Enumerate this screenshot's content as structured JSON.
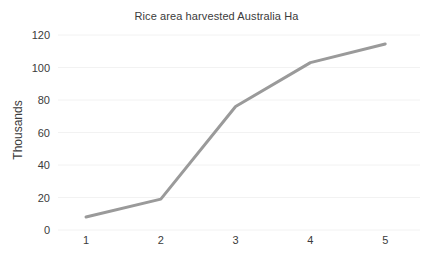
{
  "chart_data": {
    "type": "line",
    "title": "Rice area harvested Australia Ha",
    "xlabel": "",
    "ylabel": "Thousands",
    "x": [
      1,
      2,
      3,
      4,
      5
    ],
    "categories": [
      "1",
      "2",
      "3",
      "4",
      "5"
    ],
    "values": [
      8,
      19,
      76,
      103,
      114.5
    ],
    "series": [
      {
        "name": "Rice area harvested Australia Ha",
        "values": [
          8,
          19,
          76,
          103,
          114.5
        ]
      }
    ],
    "ylim": [
      0,
      120
    ],
    "yticks": [
      0,
      20,
      40,
      60,
      80,
      100,
      120
    ],
    "ytick_labels": [
      "0",
      "20",
      "40",
      "60",
      "80",
      "100",
      "120"
    ],
    "xtick_labels": [
      "1",
      "2",
      "3",
      "4",
      "5"
    ],
    "grid": "horizontal",
    "legend": "none",
    "line_color": "#9a9a9a",
    "grid_color": "#f2f2f2",
    "text_color": "#3b3b3b",
    "background": "#ffffff"
  }
}
